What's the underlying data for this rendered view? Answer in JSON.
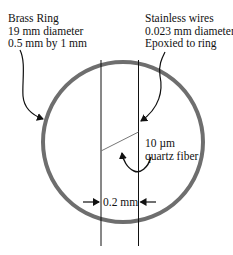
{
  "diagram": {
    "brass_ring_label": {
      "line1": "Brass Ring",
      "line2": "19 mm diameter",
      "line3": "0.5 mm by 1 mm"
    },
    "wires_label": {
      "line1": "Stainless wires",
      "line2": "0.023 mm diameter",
      "line3": "Epoxied to ring"
    },
    "fiber_label": {
      "line1": "10 µm",
      "line2": "quartz fiber"
    },
    "gap_dimension": "0.2 mm",
    "colors": {
      "ring": "#6e6e6e",
      "lines": "#111111",
      "fiber": "#777777",
      "background": "#ffffff"
    }
  }
}
